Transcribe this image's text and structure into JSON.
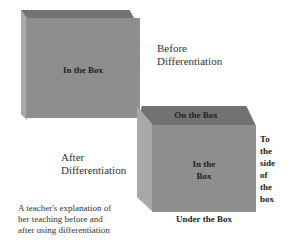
{
  "before_box": {
    "label": "In the Box"
  },
  "before_caption": {
    "line1": "Before",
    "line2": "Differentiation"
  },
  "after_caption": {
    "line1": "After",
    "line2": "Differentiation"
  },
  "after_box": {
    "top_label": "On the Box",
    "front_label_line1": "In the",
    "front_label_line2": "Box",
    "side_label": [
      "To",
      "the",
      "side",
      "of",
      "the",
      "box"
    ],
    "under_label": "Under the Box"
  },
  "description": {
    "line1": "A teacher's explanation of",
    "line2": "her teaching before and",
    "line3": "after using differentiation"
  },
  "colors": {
    "front": "#8e8e8e",
    "top": "#727272",
    "left": "#a9a9a9"
  }
}
